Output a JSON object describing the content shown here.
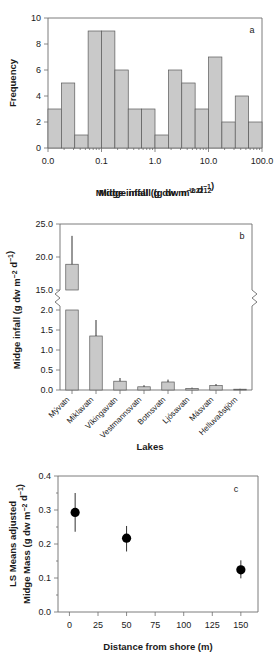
{
  "figure": {
    "background": "#ffffff",
    "bar_fill": "#c9c9c9",
    "bar_stroke": "#5a5a5a",
    "axis_color": "#6d6d6d",
    "point_color": "#000000"
  },
  "chart_data": [
    {
      "type": "bar",
      "panel_label": "a",
      "title": "",
      "xlabel": "Midge infall (g dw m⁻² d⁻¹)",
      "ylabel": "Frequency",
      "xscale": "log",
      "xtick_labels": [
        "0.0",
        "0.1",
        "1.0",
        "10.0",
        "100.0"
      ],
      "xtick_values": [
        0.01,
        0.1,
        1.0,
        10.0,
        100.0
      ],
      "ytick_labels": [
        "0",
        "2",
        "4",
        "6",
        "8",
        "10"
      ],
      "ylim": [
        0,
        10
      ],
      "grid": false,
      "legend": "none",
      "categories": [
        "bin1",
        "bin2",
        "bin3",
        "bin4",
        "bin5",
        "bin6",
        "bin7",
        "bin8",
        "bin9",
        "bin10",
        "bin11",
        "bin12",
        "bin13",
        "bin14",
        "bin15",
        "bin16"
      ],
      "values": [
        3,
        5,
        1,
        9,
        9,
        6,
        3,
        3,
        1,
        6,
        5,
        3,
        7,
        2,
        4,
        2
      ]
    },
    {
      "type": "bar",
      "panel_label": "b",
      "title": "",
      "xlabel": "Lakes",
      "ylabel": "Midge infall (g dw m⁻² d⁻¹)",
      "broken_axis": true,
      "upper_ylim": [
        15.0,
        25.0
      ],
      "upper_ytick_labels": [
        "15.0",
        "20.0",
        "25.0"
      ],
      "lower_ylim": [
        0.0,
        2.0
      ],
      "lower_ytick_labels": [
        "0.0",
        "0.5",
        "1.0",
        "1.5",
        "2.0"
      ],
      "grid": false,
      "legend": "none",
      "categories": [
        "Mývatn",
        "Miklavatn",
        "Víkingavatn",
        "Vestmannsvatn",
        "Botnsvatn",
        "Ljósavatn",
        "Másvatn",
        "Helluvaðstjörn"
      ],
      "values": [
        18.9,
        1.35,
        0.22,
        0.08,
        0.2,
        0.04,
        0.11,
        0.02
      ],
      "errors_upper": [
        23.2,
        1.75,
        0.3,
        0.12,
        0.26,
        0.06,
        0.15,
        0.03
      ]
    },
    {
      "type": "scatter",
      "panel_label": "c",
      "title": "",
      "xlabel": "Distance from shore (m)",
      "ylabel": "LS Means adjusted Midge Mass (g dw m⁻² d⁻¹)",
      "xtick_labels": [
        "0",
        "25",
        "50",
        "75",
        "100",
        "125",
        "150"
      ],
      "xtick_values": [
        0,
        25,
        50,
        75,
        100,
        125,
        150
      ],
      "ytick_labels": [
        "0.0",
        "0.1",
        "0.2",
        "0.3",
        "0.4"
      ],
      "ylim": [
        0.0,
        0.4
      ],
      "xlim": [
        -10,
        165
      ],
      "grid": false,
      "legend": "none",
      "x": [
        5,
        50,
        150
      ],
      "y": [
        0.293,
        0.217,
        0.124
      ],
      "err_low": [
        0.236,
        0.178,
        0.099
      ],
      "err_high": [
        0.35,
        0.253,
        0.152
      ]
    }
  ]
}
